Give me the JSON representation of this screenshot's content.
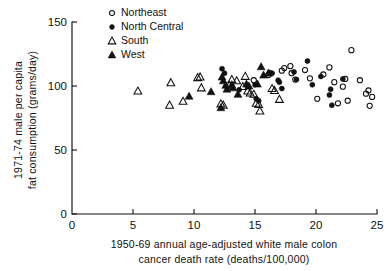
{
  "chart_data": {
    "type": "scatter",
    "title": "",
    "xlabel": "1950-69  annual  age-adjusted  white  male  colon cancer death rate   (deaths/100,000)",
    "xlabel_line1": "1950-69  annual  age-adjusted  white  male  colon",
    "xlabel_line2": "cancer  death  rate    (deaths/100,000)",
    "ylabel": "1971-74 male per capita fat consumption (grams/day)",
    "ylabel_line1": "1971-74  male  per  capita",
    "ylabel_line2": "fat  consumption  (grams/day)",
    "xlim": [
      0,
      25
    ],
    "ylim": [
      0,
      150
    ],
    "xticks": [
      0,
      5,
      10,
      15,
      20,
      25
    ],
    "yticks": [
      0,
      50,
      100,
      150
    ],
    "xtick_labels": [
      "0",
      "5",
      "10",
      "15",
      "20",
      "25"
    ],
    "ytick_labels": [
      "0",
      "50",
      "100",
      "150"
    ],
    "grid": false,
    "legend_position": "top-left-inside",
    "marker_color": "#111111",
    "series": [
      {
        "name": "Northeast",
        "marker": "open-circle",
        "points": [
          [
            14.9,
            104.5
          ],
          [
            16.1,
            108.5
          ],
          [
            17.2,
            112.0
          ],
          [
            17.4,
            114.0
          ],
          [
            17.9,
            115.5
          ],
          [
            18.0,
            110.0
          ],
          [
            18.3,
            105.0
          ],
          [
            19.1,
            112.5
          ],
          [
            19.5,
            106.0
          ],
          [
            20.1,
            90.0
          ],
          [
            20.6,
            109.0
          ],
          [
            21.1,
            114.5
          ],
          [
            21.5,
            103.0
          ],
          [
            21.8,
            86.5
          ],
          [
            22.2,
            99.5
          ],
          [
            22.4,
            105.5
          ],
          [
            22.6,
            88.5
          ],
          [
            22.9,
            128.0
          ],
          [
            23.6,
            104.5
          ],
          [
            24.1,
            94.0
          ],
          [
            24.3,
            96.5
          ],
          [
            24.6,
            91.5
          ],
          [
            24.4,
            84.5
          ]
        ]
      },
      {
        "name": "North Central",
        "marker": "filled-circle",
        "points": [
          [
            12.3,
            113.5
          ],
          [
            12.5,
            110.0
          ],
          [
            13.7,
            97.0
          ],
          [
            15.1,
            90.0
          ],
          [
            15.3,
            88.5
          ],
          [
            16.2,
            110.5
          ],
          [
            16.4,
            110.0
          ],
          [
            16.9,
            104.5
          ],
          [
            17.0,
            103.0
          ],
          [
            17.2,
            98.0
          ],
          [
            18.2,
            111.0
          ],
          [
            18.4,
            105.0
          ],
          [
            19.3,
            119.5
          ],
          [
            19.7,
            101.0
          ],
          [
            20.4,
            107.5
          ],
          [
            21.1,
            93.0
          ],
          [
            21.2,
            97.5
          ],
          [
            21.3,
            85.0
          ],
          [
            22.2,
            105.5
          ],
          [
            15.0,
            101.0
          ]
        ]
      },
      {
        "name": "South",
        "marker": "open-triangle",
        "points": [
          [
            5.4,
            96.0
          ],
          [
            8.0,
            85.0
          ],
          [
            8.1,
            102.5
          ],
          [
            9.1,
            88.0
          ],
          [
            10.3,
            106.5
          ],
          [
            10.5,
            107.0
          ],
          [
            10.6,
            98.5
          ],
          [
            12.2,
            86.0
          ],
          [
            12.4,
            85.0
          ],
          [
            13.1,
            105.0
          ],
          [
            13.5,
            104.0
          ],
          [
            14.2,
            107.5
          ],
          [
            14.4,
            96.0
          ],
          [
            14.6,
            94.5
          ],
          [
            14.9,
            93.5
          ],
          [
            15.1,
            86.5
          ],
          [
            15.3,
            85.5
          ],
          [
            15.4,
            80.5
          ],
          [
            16.4,
            98.0
          ],
          [
            16.6,
            96.5
          ],
          [
            17.0,
            89.5
          ],
          [
            12.9,
            100.5
          ],
          [
            14.0,
            99.5
          ]
        ]
      },
      {
        "name": "West",
        "marker": "filled-triangle",
        "points": [
          [
            9.6,
            92.0
          ],
          [
            12.2,
            83.0
          ],
          [
            12.4,
            104.0
          ],
          [
            12.6,
            100.5
          ],
          [
            12.7,
            97.5
          ],
          [
            13.1,
            101.0
          ],
          [
            13.2,
            98.5
          ],
          [
            13.6,
            93.5
          ],
          [
            14.3,
            101.5
          ],
          [
            14.5,
            100.0
          ],
          [
            15.2,
            101.5
          ],
          [
            15.5,
            115.0
          ],
          [
            15.7,
            108.5
          ],
          [
            16.1,
            110.0
          ],
          [
            12.3,
            107.0
          ],
          [
            11.4,
            95.5
          ]
        ]
      }
    ]
  },
  "legend": {
    "items": [
      {
        "label": "Northeast",
        "marker": "open-circle"
      },
      {
        "label": "North Central",
        "marker": "filled-circle"
      },
      {
        "label": "South",
        "marker": "open-triangle"
      },
      {
        "label": "West",
        "marker": "filled-triangle"
      }
    ]
  }
}
